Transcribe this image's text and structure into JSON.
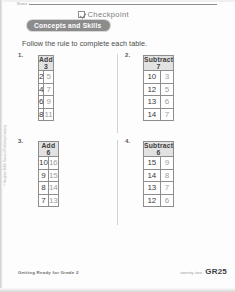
{
  "header": {
    "name_label": "Name",
    "checkpoint_label": "Checkpoint",
    "checkpoint_icon": "checkbox-checked-icon",
    "banner_label": "Concepts and Skills"
  },
  "instruction": "Follow the rule to complete each table.",
  "problems": [
    {
      "number": "1.",
      "rule": "Add 3",
      "rows": [
        {
          "input": "2",
          "output": "5"
        },
        {
          "input": "4",
          "output": "7"
        },
        {
          "input": "6",
          "output": "9"
        },
        {
          "input": "8",
          "output": "11"
        }
      ]
    },
    {
      "number": "2.",
      "rule": "Subtract 7",
      "rows": [
        {
          "input": "10",
          "output": "3"
        },
        {
          "input": "12",
          "output": "5"
        },
        {
          "input": "13",
          "output": "6"
        },
        {
          "input": "14",
          "output": "7"
        }
      ]
    },
    {
      "number": "3.",
      "rule": "Add 6",
      "rows": [
        {
          "input": "10",
          "output": "16"
        },
        {
          "input": "9",
          "output": "15"
        },
        {
          "input": "8",
          "output": "14"
        },
        {
          "input": "7",
          "output": "13"
        }
      ]
    },
    {
      "number": "4.",
      "rule": "Subtract 6",
      "rows": [
        {
          "input": "15",
          "output": "9"
        },
        {
          "input": "14",
          "output": "8"
        },
        {
          "input": "13",
          "output": "7"
        },
        {
          "input": "12",
          "output": "6"
        }
      ]
    }
  ],
  "side_copyright": "© Houghton Mifflin Harcourt Publishing Company",
  "footer": {
    "left": "Getting Ready for Grade 2",
    "page_words": "twenty-two",
    "page_code": "GR25"
  }
}
